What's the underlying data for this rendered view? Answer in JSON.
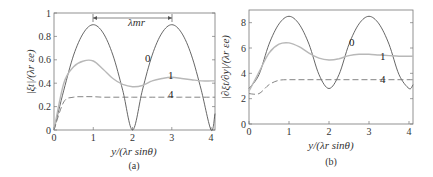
{
  "chart_data": [
    {
      "type": "line",
      "panel": "(a)",
      "title": "",
      "xlabel": "y/(λ_r sinθ)",
      "ylabel": "|ξ_t|/(λ_r ε_e)",
      "xlim": [
        0,
        4.1
      ],
      "ylim": [
        0,
        1
      ],
      "xticks": [
        "0",
        "1",
        "2",
        "3",
        "4"
      ],
      "yticks": [
        "0",
        "0.2",
        "0.4",
        "0.6",
        "0.8",
        "1"
      ],
      "annotation": "λ_mr",
      "annotation_span": [
        1,
        3
      ],
      "grid": false,
      "x": [
        0,
        0.25,
        0.5,
        0.75,
        1,
        1.25,
        1.5,
        1.75,
        2,
        2.25,
        2.5,
        2.75,
        3,
        3.25,
        3.5,
        3.75,
        4,
        4.1
      ],
      "series": [
        {
          "name": "0",
          "style": "solid",
          "color": "#555555",
          "values": [
            0,
            0.34,
            0.64,
            0.83,
            0.9,
            0.83,
            0.64,
            0.34,
            0,
            0.34,
            0.64,
            0.83,
            0.9,
            0.83,
            0.64,
            0.34,
            0,
            0.14
          ]
        },
        {
          "name": "1",
          "style": "solid-light",
          "color": "#b8b8b8",
          "values": [
            0,
            0.4,
            0.54,
            0.59,
            0.59,
            0.52,
            0.44,
            0.39,
            0.37,
            0.38,
            0.42,
            0.44,
            0.45,
            0.44,
            0.43,
            0.42,
            0.42,
            0.42
          ]
        },
        {
          "name": "4",
          "style": "dashed",
          "color": "#777777",
          "values": [
            0,
            0.24,
            0.28,
            0.285,
            0.285,
            0.28,
            0.28,
            0.28,
            0.28,
            0.28,
            0.28,
            0.28,
            0.28,
            0.28,
            0.28,
            0.28,
            0.28,
            0.28
          ]
        }
      ]
    },
    {
      "type": "line",
      "panel": "(b)",
      "title": "",
      "xlabel": "y/(λ_r sinθ)",
      "ylabel": "|∂ξ_t/∂y|/(λ_r ε_e)",
      "xlim": [
        0,
        4.1
      ],
      "ylim": [
        0,
        9
      ],
      "xticks": [
        "0",
        "1",
        "2",
        "3",
        "4"
      ],
      "yticks": [
        "0",
        "2",
        "4",
        "6",
        "8"
      ],
      "grid": false,
      "x": [
        0,
        0.25,
        0.5,
        0.75,
        1,
        1.25,
        1.5,
        1.75,
        2,
        2.25,
        2.5,
        2.75,
        3,
        3.25,
        3.5,
        3.75,
        4,
        4.1
      ],
      "series": [
        {
          "name": "0",
          "style": "solid",
          "color": "#555555",
          "values": [
            2.8,
            3.9,
            6.3,
            7.9,
            8.5,
            7.9,
            6.3,
            3.9,
            2.8,
            3.9,
            6.3,
            7.9,
            8.5,
            7.9,
            6.3,
            3.9,
            2.8,
            3.1
          ]
        },
        {
          "name": "1",
          "style": "solid-light",
          "color": "#b8b8b8",
          "values": [
            2.6,
            4.1,
            5.6,
            6.3,
            6.4,
            6.1,
            5.6,
            5.2,
            5.05,
            5.15,
            5.4,
            5.5,
            5.5,
            5.45,
            5.4,
            5.35,
            5.35,
            5.35
          ]
        },
        {
          "name": "4",
          "style": "dashed",
          "color": "#777777",
          "values": [
            2.4,
            2.4,
            3.1,
            3.45,
            3.5,
            3.5,
            3.5,
            3.5,
            3.5,
            3.5,
            3.5,
            3.5,
            3.5,
            3.5,
            3.5,
            3.5,
            3.5,
            3.5
          ]
        }
      ]
    }
  ],
  "panels": {
    "a": {
      "caption": "(a)",
      "xlabel": "y/(λr sinθ)",
      "ylabel": "|ξt|/(λr εe)",
      "annotation": "λmr",
      "curve_labels": [
        "0",
        "1",
        "4"
      ]
    },
    "b": {
      "caption": "(b)",
      "xlabel": "y/(λr sinθ)",
      "ylabel": "|∂ξt/∂y|/(λr εe)",
      "curve_labels": [
        "0",
        "1",
        "4"
      ]
    }
  }
}
